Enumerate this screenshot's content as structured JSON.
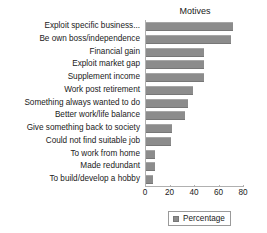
{
  "chart_data": {
    "type": "bar",
    "orientation": "horizontal",
    "title": "Motives",
    "xlabel": "",
    "ylabel": "",
    "xlim": [
      0,
      80
    ],
    "xticks": [
      0,
      20,
      40,
      60,
      80
    ],
    "grid": false,
    "legend": {
      "position": "bottom",
      "entries": [
        {
          "name": "Percentage",
          "color": "#8c8c8c"
        }
      ]
    },
    "categories": [
      "Exploit specific business...",
      "Be own boss/independence",
      "Financial gain",
      "Exploit market gap",
      "Supplement income",
      "Work post retirement",
      "Something always wanted to do",
      "Better work/life balance",
      "Give something back to society",
      "Could not find suitable job",
      "To work from home",
      "Made redundant",
      "To build/develop a hobby"
    ],
    "series": [
      {
        "name": "Percentage",
        "color": "#8c8c8c",
        "values": [
          71,
          69,
          47,
          47,
          47,
          38,
          34,
          32,
          21,
          20,
          7,
          7,
          6
        ]
      }
    ]
  },
  "colors": {
    "bar": "#8c8c8c",
    "axis": "#b0b0b0",
    "text": "#1a1a1a",
    "background": "#ffffff"
  }
}
